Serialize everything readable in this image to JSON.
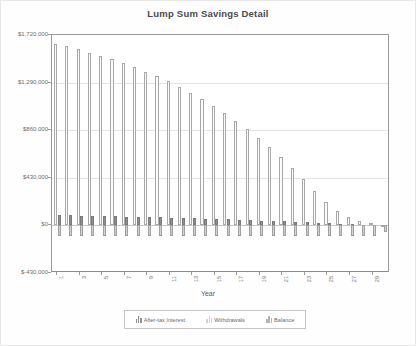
{
  "chart_data": {
    "type": "bar",
    "title": "Lump Sum Savings Detail",
    "xlabel": "Year",
    "ylabel": "",
    "ylim": [
      -430000,
      1720000
    ],
    "grid": true,
    "legend_position": "bottom",
    "ytick_labels": [
      "$1,720,000",
      "$1,290,000",
      "$860,000",
      "$430,000",
      "$0",
      "$-430,000"
    ],
    "ytick_values": [
      1720000,
      1290000,
      860000,
      430000,
      0,
      -430000
    ],
    "categories": [
      1,
      2,
      3,
      4,
      5,
      6,
      7,
      8,
      9,
      10,
      11,
      12,
      13,
      14,
      15,
      16,
      17,
      18,
      19,
      20,
      21,
      22,
      23,
      24,
      25,
      26,
      27,
      28,
      29,
      30
    ],
    "xtick_labels": [
      "1",
      "3",
      "5",
      "7",
      "9",
      "11",
      "13",
      "15",
      "17",
      "19",
      "21",
      "23",
      "25",
      "27",
      "29"
    ],
    "series": [
      {
        "name": "After-tax Interest",
        "color": "#8f8f8f",
        "values": [
          92000,
          90000,
          88000,
          86000,
          84000,
          82000,
          80000,
          78000,
          75000,
          73000,
          70000,
          67000,
          64000,
          61000,
          58000,
          55000,
          51000,
          47000,
          44000,
          40000,
          36000,
          31000,
          27000,
          23000,
          18000,
          14000,
          10000,
          6000,
          3000,
          1000
        ]
      },
      {
        "name": "Withdrawals",
        "color": "#d2d2d2",
        "values": [
          -100000,
          -100000,
          -100000,
          -100000,
          -100000,
          -100000,
          -100000,
          -100000,
          -100000,
          -100000,
          -100000,
          -100000,
          -100000,
          -100000,
          -100000,
          -100000,
          -100000,
          -100000,
          -100000,
          -100000,
          -100000,
          -100000,
          -100000,
          -100000,
          -100000,
          -100000,
          -100000,
          -100000,
          -100000,
          -60000
        ]
      },
      {
        "name": "Balance",
        "color": "#fbfbfb",
        "values": [
          1640000,
          1620000,
          1590000,
          1560000,
          1530000,
          1500000,
          1465000,
          1430000,
          1390000,
          1350000,
          1300000,
          1250000,
          1195000,
          1140000,
          1080000,
          1015000,
          945000,
          870000,
          790000,
          705000,
          615000,
          520000,
          420000,
          315000,
          210000,
          130000,
          75000,
          40000,
          20000,
          5000
        ]
      }
    ]
  },
  "legend": {
    "items": [
      {
        "label": "After-tax Interest"
      },
      {
        "label": "Withdrawals"
      },
      {
        "label": "Balance"
      }
    ]
  }
}
